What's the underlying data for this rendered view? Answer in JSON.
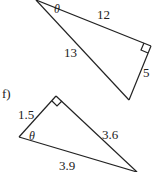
{
  "diagram": {
    "triangle_e": {
      "angle_label": "θ",
      "adjacent": "12",
      "hypotenuse": "13",
      "opposite": "5",
      "right_angle_marker": true
    },
    "triangle_f": {
      "part_label": "f)",
      "angle_label": "θ",
      "side_short": "1.5",
      "side_long": "3.6",
      "hypotenuse": "3.9",
      "right_angle_marker": true
    }
  }
}
